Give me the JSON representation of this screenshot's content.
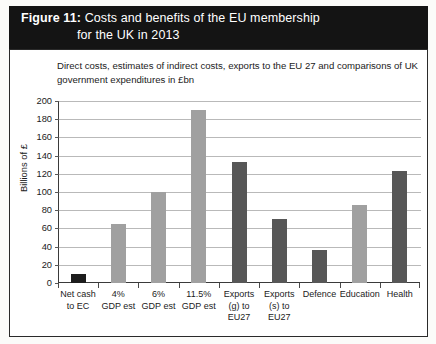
{
  "figure": {
    "label": "Figure 11:",
    "title_line1": "Costs and benefits of the EU membership",
    "title_line2": "for the UK in 2013",
    "subtitle": "Direct costs, estimates of indirect costs, exports to the EU 27 and comparisons of UK government expenditures in £bn"
  },
  "colors": {
    "titlebar_bg": "#141414",
    "titlebar_text": "#ffffff",
    "bar_dark": "#575757",
    "bar_black": "#1d1d1d",
    "bar_light": "#a0a0a0",
    "gridline": "#b9b9b9",
    "axis": "#3a3a3a",
    "frame": "#2a2a2a",
    "plot_bg": "#ffffff"
  },
  "chart_data": {
    "type": "bar",
    "title": "Costs and benefits of the EU membership for the UK in 2013",
    "subtitle": "Direct costs, estimates of indirect costs, exports to the EU 27 and comparisons of UK government expenditures in £bn",
    "xlabel": "",
    "ylabel": "Billions of £",
    "ylim": [
      0,
      200
    ],
    "yticks": [
      0,
      20,
      40,
      60,
      80,
      100,
      120,
      140,
      160,
      180,
      200
    ],
    "grid": true,
    "legend": null,
    "categories": [
      "Net cash to EC",
      "4% GDP est",
      "6% GDP est",
      "11.5% GDP est",
      "Exports (g) to EU27",
      "Exports (s) to EU27",
      "Defence",
      "Education",
      "Health"
    ],
    "category_label_lines": [
      [
        "Net cash",
        "to EC"
      ],
      [
        "4%",
        "GDP est"
      ],
      [
        "6%",
        "GDP est"
      ],
      [
        "11.5%",
        "GDP est"
      ],
      [
        "Exports",
        "(g) to",
        "EU27"
      ],
      [
        "Exports",
        "(s) to",
        "EU27"
      ],
      [
        "Defence"
      ],
      [
        "Education"
      ],
      [
        "Health"
      ]
    ],
    "values": [
      10,
      65,
      100,
      190,
      133,
      70,
      36,
      86,
      123
    ],
    "bar_colors": [
      "#1d1d1d",
      "#a0a0a0",
      "#a0a0a0",
      "#a0a0a0",
      "#575757",
      "#575757",
      "#575757",
      "#a0a0a0",
      "#575757"
    ]
  }
}
